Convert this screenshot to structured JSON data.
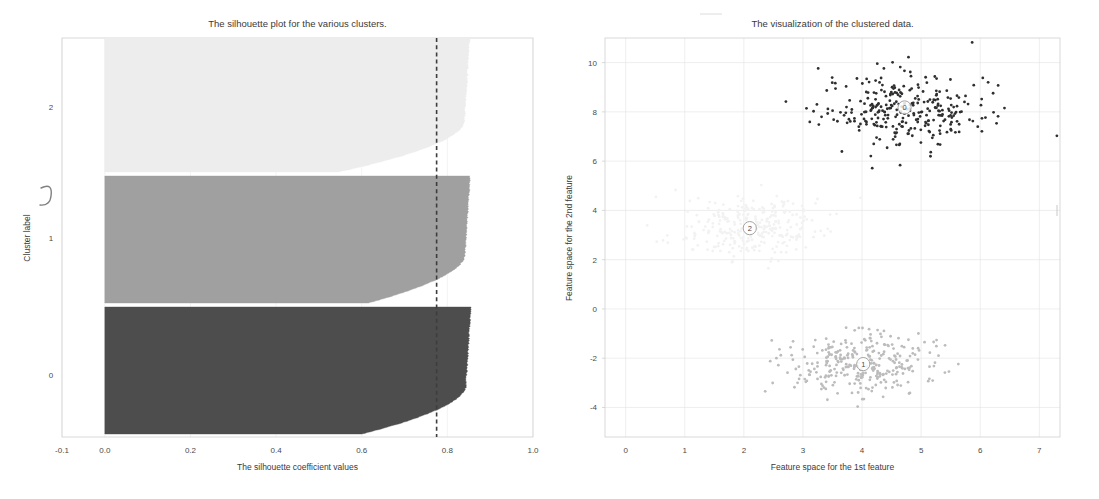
{
  "figure": {
    "width": 1099,
    "height": 499,
    "background": "#ffffff"
  },
  "chart_data": [
    {
      "type": "area",
      "name": "silhouette-plot",
      "title": "The silhouette plot for the various clusters.",
      "xlabel": "The silhouette coefficient values",
      "ylabel": "Cluster label",
      "xlim": [
        -0.1,
        1.0
      ],
      "xticks": [
        -0.1,
        0.0,
        0.2,
        0.4,
        0.6,
        0.8,
        1.0
      ],
      "xticklabels": [
        "-0.1",
        "0.0",
        "0.2",
        "0.4",
        "0.6",
        "0.8",
        "1.0"
      ],
      "yticks": [
        0,
        1,
        2
      ],
      "yticklabels": [
        "0",
        "1",
        "2"
      ],
      "ylim": [
        0,
        1530
      ],
      "grid": true,
      "legend": "none",
      "average_silhouette_score": 0.7749,
      "avg_line_style": "dashed",
      "avg_line_color": "#3d3d3d",
      "clusters": [
        {
          "label": "0",
          "color": "#4d4d4d",
          "size": 500,
          "max_silhouette": 0.855,
          "min_silhouette": 0.6,
          "y_center_px": 375
        },
        {
          "label": "1",
          "color": "#a0a0a0",
          "size": 500,
          "max_silhouette": 0.853,
          "min_silhouette": 0.615,
          "y_center_px": 238
        },
        {
          "label": "2",
          "color": "#ededed",
          "size": 500,
          "max_silhouette": 0.852,
          "min_silhouette": 0.545,
          "y_center_px": 107
        }
      ]
    },
    {
      "type": "scatter",
      "name": "cluster-scatter",
      "title": "The visualization of the clustered data.",
      "xlabel": "Feature space for the 1st feature",
      "ylabel": "Feature space for the 2nd feature",
      "xlim": [
        -0.35,
        7.35
      ],
      "ylim": [
        -5.2,
        11.0
      ],
      "xticks": [
        0,
        1,
        2,
        3,
        4,
        5,
        6,
        7
      ],
      "xticklabels": [
        "0",
        "1",
        "2",
        "3",
        "4",
        "5",
        "6",
        "7"
      ],
      "yticks": [
        -4,
        -2,
        0,
        2,
        4,
        6,
        8,
        10
      ],
      "yticklabels": [
        "-4",
        "-2",
        "0",
        "2",
        "4",
        "6",
        "8",
        "10"
      ],
      "grid": true,
      "legend": "none",
      "marker": "point",
      "marker_size": 1.4,
      "clusters": [
        {
          "label": "0",
          "color": "#2f2f2f",
          "n": 300,
          "center": [
            4.72,
            8.18
          ],
          "spread": [
            0.7,
            0.75
          ],
          "centroid_marker": "0"
        },
        {
          "label": "1",
          "color": "#bcbcbc",
          "n": 300,
          "center": [
            4.02,
            -2.24
          ],
          "spread": [
            0.62,
            0.68
          ],
          "centroid_marker": "1"
        },
        {
          "label": "2",
          "color": "#f2f2f2",
          "n": 300,
          "center": [
            2.1,
            3.28
          ],
          "spread": [
            0.55,
            0.6
          ],
          "centroid_marker": "2"
        }
      ]
    }
  ]
}
